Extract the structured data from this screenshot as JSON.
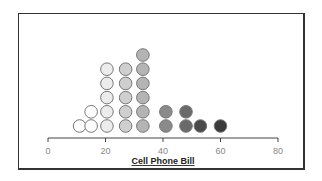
{
  "chart_data": {
    "type": "scatter",
    "subtype": "dot-plot",
    "title": "",
    "xlabel": "Cell Phone Bill",
    "ylabel": "",
    "xlim": [
      0,
      80
    ],
    "xticks": [
      0,
      20,
      40,
      60,
      80
    ],
    "grid": false,
    "legend": null,
    "columns": [
      {
        "x": 11,
        "count": 1,
        "color": "#ffffff"
      },
      {
        "x": 15,
        "count": 2,
        "color": "#ffffff"
      },
      {
        "x": 20.5,
        "count": 5,
        "color": "#ececec"
      },
      {
        "x": 27,
        "count": 5,
        "color": "#cfcfcf"
      },
      {
        "x": 33,
        "count": 6,
        "color": "#b4b4b4"
      },
      {
        "x": 41,
        "count": 2,
        "color": "#8a8a8a"
      },
      {
        "x": 48,
        "count": 2,
        "color": "#6a6a6a"
      },
      {
        "x": 53,
        "count": 1,
        "color": "#4a4a4a"
      },
      {
        "x": 60,
        "count": 1,
        "color": "#3a3a3a"
      }
    ],
    "total_points": 25
  }
}
